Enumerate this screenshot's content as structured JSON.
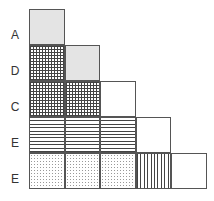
{
  "diagram": {
    "type": "staircase-grid",
    "rows": [
      {
        "label": "A",
        "cells": [
          "gray"
        ]
      },
      {
        "label": "D",
        "cells": [
          "grid",
          "gray"
        ]
      },
      {
        "label": "C",
        "cells": [
          "grid",
          "grid",
          "blank"
        ]
      },
      {
        "label": "E",
        "cells": [
          "hlines",
          "hlines",
          "hlines",
          "blank"
        ]
      },
      {
        "label": "E",
        "cells": [
          "dots",
          "dots",
          "dots",
          "vlines",
          "blank"
        ]
      }
    ],
    "pattern_legend": {
      "gray": "solid light gray fill",
      "grid": "crosshatch grid",
      "hlines": "horizontal lines",
      "vlines": "vertical lines",
      "dots": "dotted fill",
      "blank": "empty"
    },
    "colors": {
      "border": "#555555",
      "gray_fill": "#e4e4e4",
      "hatch": "#444444"
    }
  }
}
